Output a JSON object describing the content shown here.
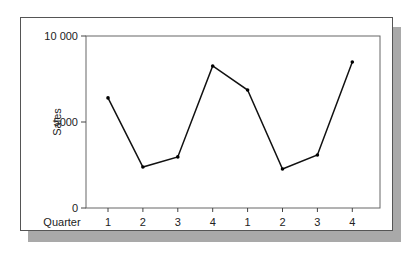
{
  "chart_data": {
    "type": "line",
    "title": "",
    "xlabel": "Quarter",
    "ylabel": "Sales",
    "categories": [
      "1",
      "2",
      "3",
      "4",
      "1",
      "2",
      "3",
      "4"
    ],
    "values": [
      6400,
      2380,
      2970,
      8260,
      6860,
      2270,
      3080,
      8490
    ],
    "ylim": [
      0,
      10000
    ],
    "yticks": [
      0,
      5000,
      10000
    ],
    "ytick_labels": [
      "0",
      "5000",
      "10 000"
    ],
    "grid": false,
    "legend": false,
    "markers": true,
    "line_color": "#111111"
  }
}
